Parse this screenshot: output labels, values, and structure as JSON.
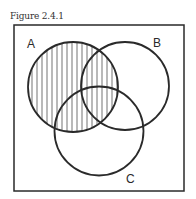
{
  "figure": {
    "title": "Figure 2.4.1"
  },
  "diagram": {
    "type": "venn",
    "universe_frame": {
      "x": 14,
      "y": 25,
      "width": 170,
      "height": 166
    },
    "sets": [
      {
        "label": "A",
        "cx": 73,
        "cy": 87,
        "r": 45,
        "shaded": true,
        "label_x": 27,
        "label_y": 48
      },
      {
        "label": "B",
        "cx": 125,
        "cy": 86,
        "r": 44,
        "shaded": false,
        "label_x": 153,
        "label_y": 47
      },
      {
        "label": "C",
        "cx": 99,
        "cy": 131,
        "r": 44.5,
        "shaded": false,
        "label_x": 126,
        "label_y": 183
      }
    ],
    "shading": {
      "pattern": "vertical-lines",
      "region": "A",
      "spacing": 5,
      "color": "#8a8a8a"
    },
    "stroke_color": "#2a2a2a"
  }
}
